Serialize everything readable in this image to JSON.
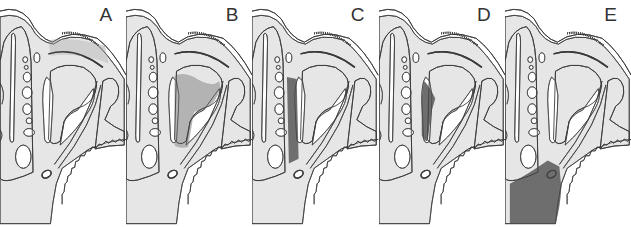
{
  "figure": {
    "type": "multi-panel anatomical cross-section diagram",
    "colors": {
      "tissue_fill": "#e6e6e6",
      "outline": "#3a3a3a",
      "light_highlight": "#cfcfcf",
      "medium_highlight": "#a9a9a9",
      "dark_highlight": "#6e6e6e",
      "background": "#ffffff"
    },
    "panels": [
      {
        "label": "A",
        "highlight": "upper-strip",
        "highlight_shade": "light"
      },
      {
        "label": "B",
        "highlight": "central-cavity",
        "highlight_shade": "medium"
      },
      {
        "label": "C",
        "highlight": "vertical-band",
        "highlight_shade": "dark"
      },
      {
        "label": "D",
        "highlight": "inner-wedge",
        "highlight_shade": "dark"
      },
      {
        "label": "E",
        "highlight": "lower-block",
        "highlight_shade": "dark"
      }
    ]
  }
}
